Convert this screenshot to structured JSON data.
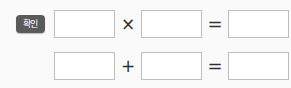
{
  "worksheet": {
    "badge": {
      "label": "확인",
      "color": "#5a5a5a",
      "text_color": "#ffffff"
    },
    "box_border_color": "#bdbdbd",
    "box_fill_color": "#ffffff",
    "background_color": "#fafafa",
    "rows": [
      {
        "id": "row-1",
        "has_badge": true,
        "operand_1": "",
        "operator_1": "×",
        "operand_2": "",
        "operator_2": "=",
        "result": "",
        "trailing_punctuation": ","
      },
      {
        "id": "row-2",
        "has_badge": false,
        "operand_1": "",
        "operator_1": "+",
        "operand_2": "",
        "operator_2": "=",
        "result": "",
        "trailing_punctuation": ""
      }
    ]
  }
}
